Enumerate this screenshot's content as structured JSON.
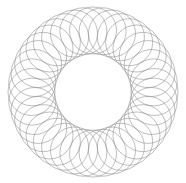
{
  "document": {
    "title": "Spirograph Rosette",
    "width": 186,
    "height": 183,
    "background_color": "#ffffff"
  },
  "figure": {
    "name": "circle-envelope-rosette",
    "description": "Annular spirograph rosette formed by many overlapping identical circles whose centers lie evenly spaced on a hidden ring, producing a woven lattice with a clear round hole in the middle.",
    "stroke_color": "#808080",
    "stroke_width": 0.6,
    "stroke_opacity": 0.85,
    "fill": "none"
  },
  "chart_data": {
    "type": "line",
    "title": "",
    "subtitle": "",
    "xlabel": "",
    "ylabel": "",
    "grid": false,
    "legend": null,
    "axes_visible": false,
    "geometry": {
      "center_x": 93,
      "center_y": 92,
      "outer_envelope_radius": 85,
      "inner_hole_radius": 38,
      "circle_radius": 23.5,
      "center_ring_radius": 61.5,
      "circle_count": 40,
      "angle_step_degrees": 9
    },
    "series": [
      {
        "name": "envelope-circles",
        "shape": "circle",
        "radius": 23.5,
        "centers_polar_radius": 61.5,
        "count": 40,
        "stroke": "#808080"
      }
    ]
  }
}
